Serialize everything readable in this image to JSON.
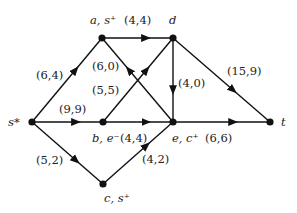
{
  "diagram": {
    "type": "flow-network",
    "nodes": [
      {
        "id": "a",
        "label": "a, s⁺",
        "x": 102,
        "y": 38,
        "lx": 90,
        "ly": 24
      },
      {
        "id": "d",
        "label": "d",
        "x": 173,
        "y": 38,
        "lx": 169,
        "ly": 24
      },
      {
        "id": "s",
        "label": "s*",
        "x": 32,
        "y": 122,
        "lx": 8,
        "ly": 126
      },
      {
        "id": "b",
        "label": "b, e⁻",
        "x": 103,
        "y": 122,
        "lx": 92,
        "ly": 142
      },
      {
        "id": "e",
        "label": "e, c⁺",
        "x": 173,
        "y": 122,
        "lx": 172,
        "ly": 142
      },
      {
        "id": "t",
        "label": "t",
        "x": 270,
        "y": 122,
        "lx": 281,
        "ly": 126
      },
      {
        "id": "c",
        "label": "c, s⁺",
        "x": 103,
        "y": 184,
        "lx": 104,
        "ly": 202
      }
    ],
    "edges": [
      {
        "from": "s",
        "to": "a",
        "label": "(6,4)",
        "lx": 36,
        "ly": 79
      },
      {
        "from": "a",
        "to": "d",
        "label": "(4,4)",
        "lx": 124,
        "ly": 24
      },
      {
        "from": "s",
        "to": "b",
        "label": "(9,9)",
        "lx": 59,
        "ly": 113
      },
      {
        "from": "b",
        "to": "e",
        "label": "(4,4)",
        "lx": 120,
        "ly": 142
      },
      {
        "from": "s",
        "to": "c",
        "label": "(5,2)",
        "lx": 36,
        "ly": 164
      },
      {
        "from": "c",
        "to": "e",
        "label": "(4,2)",
        "lx": 142,
        "ly": 163
      },
      {
        "from": "e",
        "to": "a",
        "label": "(6,0)",
        "lx": 92,
        "ly": 70
      },
      {
        "from": "b",
        "to": "d",
        "label": "(5,5)",
        "lx": 92,
        "ly": 94
      },
      {
        "from": "d",
        "to": "e",
        "label": "(4,0)",
        "lx": 178,
        "ly": 87
      },
      {
        "from": "d",
        "to": "t",
        "label": "(15,9)",
        "lx": 227,
        "ly": 75
      },
      {
        "from": "e",
        "to": "t",
        "label": "(6,6)",
        "lx": 205,
        "ly": 142
      }
    ]
  }
}
